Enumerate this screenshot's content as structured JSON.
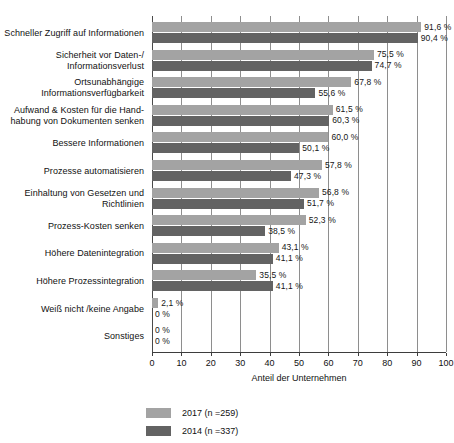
{
  "chart_data": {
    "type": "bar",
    "orientation": "horizontal",
    "title": "",
    "xlabel": "Anteil der Unternehmen",
    "ylabel": "",
    "xlim": [
      0,
      100
    ],
    "xticks": [
      0,
      10,
      20,
      30,
      40,
      50,
      60,
      70,
      80,
      90,
      100
    ],
    "grid": true,
    "legend_position": "bottom",
    "categories": [
      "Schneller Zugriff auf Informationen",
      "Sicherheit vor Daten-/ Informationsverlust",
      "Ortsunabhängige Informationsverfügbarkeit",
      "Aufwand & Kosten für die Handhabung von Dokumenten senken",
      "Bessere Informationen",
      "Prozesse automatisieren",
      "Einhaltung von Gesetzen und Richtlinien",
      "Prozess-Kosten senken",
      "Höhere Datenintegration",
      "Höhere Prozessintegration",
      "Weiß nicht /keine Angabe",
      "Sonstiges"
    ],
    "category_lines": [
      [
        "Schneller Zugriff auf Informationen"
      ],
      [
        "Sicherheit vor Daten-/",
        "Informationsverlust"
      ],
      [
        "Ortsunabhängige",
        "Informationsverfügbarkeit"
      ],
      [
        "Aufwand & Kosten für die Hand-",
        "habung von Dokumenten senken"
      ],
      [
        "Bessere Informationen"
      ],
      [
        "Prozesse automatisieren"
      ],
      [
        "Einhaltung von Gesetzen und",
        "Richtlinien"
      ],
      [
        "Prozess-Kosten senken"
      ],
      [
        "Höhere Datenintegration"
      ],
      [
        "Höhere Prozessintegration"
      ],
      [
        "Weiß nicht /keine Angabe"
      ],
      [
        "Sonstiges"
      ]
    ],
    "series": [
      {
        "name": "2017 (n =259)",
        "color": "#a3a3a3",
        "values": [
          91.6,
          75.5,
          67.8,
          61.5,
          60.0,
          57.8,
          56.8,
          52.3,
          43.1,
          35.5,
          2.1,
          0
        ],
        "value_labels": [
          "91,6 %",
          "75,5 %",
          "67,8 %",
          "61,5 %",
          "60,0 %",
          "57,8 %",
          "56,8 %",
          "52,3 %",
          "43,1 %",
          "35,5 %",
          "2,1 %",
          "0 %"
        ]
      },
      {
        "name": "2014 (n =337)",
        "color": "#636363",
        "values": [
          90.4,
          74.7,
          55.6,
          60.3,
          50.1,
          47.3,
          51.7,
          38.5,
          41.1,
          41.1,
          0,
          0
        ],
        "value_labels": [
          "90,4 %",
          "74,7 %",
          "55,6 %",
          "60,3 %",
          "50,1 %",
          "47,3 %",
          "51,7 %",
          "38,5 %",
          "41,1 %",
          "41,1 %",
          "0 %",
          "0 %"
        ]
      }
    ]
  },
  "legend": [
    {
      "label": "2017 (n =259)",
      "color": "#a3a3a3"
    },
    {
      "label": "2014 (n =337)",
      "color": "#636363"
    }
  ],
  "axis": {
    "x_title": "Anteil der Unternehmen",
    "tick_labels": [
      "0",
      "10",
      "20",
      "30",
      "40",
      "50",
      "60",
      "70",
      "80",
      "90",
      "100"
    ]
  },
  "colors": {
    "series_2017": "#a3a3a3",
    "series_2014": "#636363",
    "gridline": "#8e8e8e",
    "axis": "#3d3d3d",
    "text": "#111111",
    "background": "#ffffff"
  }
}
